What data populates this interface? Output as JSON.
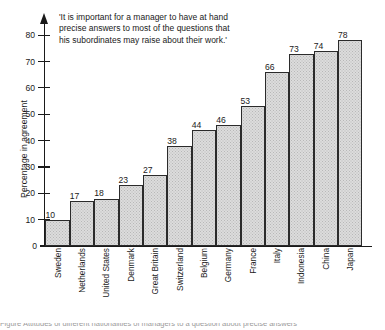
{
  "chart_data": {
    "type": "bar",
    "title": "",
    "subtitle": "",
    "quote": "'It is important for a manager to have at hand precise answers to most of the questions that his subordinates may raise about their work.'",
    "xlabel": "",
    "ylabel": "Percentage in agreement",
    "ylim": [
      0,
      85
    ],
    "yticks": [
      0,
      10,
      20,
      30,
      40,
      50,
      60,
      70,
      80
    ],
    "grid": false,
    "legend": null,
    "categories": [
      "Sweden",
      "Netherlands",
      "United States",
      "Denmark",
      "Great Britain",
      "Switzerland",
      "Belgium",
      "Germany",
      "France",
      "Italy",
      "Indonesia",
      "China",
      "Japan"
    ],
    "values": [
      10,
      17,
      18,
      23,
      27,
      38,
      44,
      46,
      53,
      66,
      73,
      74,
      78
    ],
    "bar_fill_color": "#dcdcdc",
    "bar_edge_color": "#2b2b2b",
    "axis_color": "#1a1a1a"
  },
  "caption": {
    "sliver_text": "Figure  Attitudes of different nationalities  of managers to a question about precise answers"
  }
}
